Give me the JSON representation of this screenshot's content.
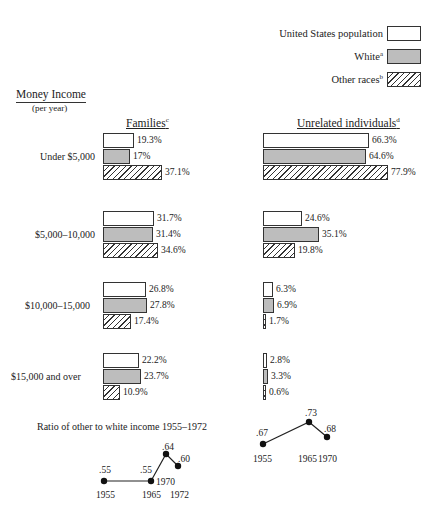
{
  "legend": {
    "items": [
      {
        "label": "United States population",
        "sup": "",
        "pattern": "white"
      },
      {
        "label": "White",
        "sup": "a",
        "pattern": "dot"
      },
      {
        "label": "Other races",
        "sup": "b",
        "pattern": "hatch"
      }
    ]
  },
  "axis": {
    "title": "Money Income",
    "subtitle": "(per year)"
  },
  "columns": {
    "families": {
      "label": "Families",
      "sup": "c"
    },
    "unrelated": {
      "label": "Unrelated individuals",
      "sup": "d"
    }
  },
  "ratio": {
    "title": "Ratio of other to white income 1955–1972"
  },
  "chart_data": [
    {
      "type": "bar",
      "orientation": "horizontal",
      "title": "Families",
      "categories": [
        "Under $5,000",
        "$5,000–10,000",
        "$10,000–15,000",
        "$15,000 and over"
      ],
      "series": [
        {
          "name": "United States population",
          "values": [
            19.3,
            31.7,
            26.8,
            22.2
          ],
          "labels": [
            "19.3%",
            "31.7%",
            "26.8%",
            "22.2%"
          ]
        },
        {
          "name": "White",
          "values": [
            17,
            31.4,
            27.8,
            23.7
          ],
          "labels": [
            "17%",
            "31.4%",
            "27.8%",
            "23.7%"
          ]
        },
        {
          "name": "Other races",
          "values": [
            37.1,
            34.6,
            17.4,
            10.9
          ],
          "labels": [
            "37.1%",
            "34.6%",
            "17.4%",
            "10.9%"
          ]
        }
      ],
      "ylabel": "Money Income (per year)",
      "unit": "%"
    },
    {
      "type": "bar",
      "orientation": "horizontal",
      "title": "Unrelated individuals",
      "categories": [
        "Under $5,000",
        "$5,000–10,000",
        "$10,000–15,000",
        "$15,000 and over"
      ],
      "series": [
        {
          "name": "United States population",
          "values": [
            66.3,
            24.6,
            6.3,
            2.8
          ],
          "labels": [
            "66.3%",
            "24.6%",
            "6.3%",
            "2.8%"
          ]
        },
        {
          "name": "White",
          "values": [
            64.6,
            35.1,
            6.9,
            3.3
          ],
          "labels": [
            "64.6%",
            "35.1%",
            "6.9%",
            "3.3%"
          ]
        },
        {
          "name": "Other races",
          "values": [
            77.9,
            19.8,
            1.7,
            0.6
          ],
          "labels": [
            "77.9%",
            "19.8%",
            "1.7%",
            "0.6%"
          ]
        }
      ],
      "unit": "%"
    },
    {
      "type": "line",
      "title": "Ratio of other to white income 1955–1972 (Families)",
      "x": [
        1955,
        1965,
        1970,
        1972
      ],
      "values": [
        0.55,
        0.55,
        0.64,
        0.6
      ],
      "labels": [
        ".55",
        ".55",
        ".64",
        ".60"
      ]
    },
    {
      "type": "line",
      "title": "Ratio of other to white income 1955–1972 (Unrelated individuals)",
      "x": [
        1955,
        1965,
        1970
      ],
      "values": [
        0.67,
        0.73,
        0.68
      ],
      "labels": [
        ".67",
        ".73",
        ".68"
      ]
    }
  ]
}
